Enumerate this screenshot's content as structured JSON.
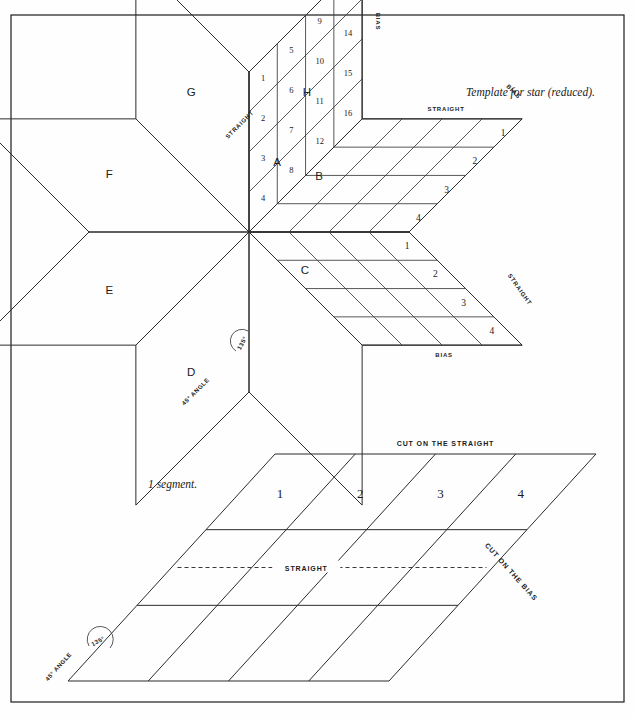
{
  "page": {
    "background": "#fefefe",
    "ink": "#2b2b2b",
    "width": 634,
    "height": 719,
    "frame": {
      "x": 11,
      "y": 15,
      "w": 613,
      "h": 687
    }
  },
  "captions": {
    "star": "Template for star (reduced).",
    "segment": "1 segment."
  },
  "star": {
    "center": {
      "x": 249,
      "y": 232
    },
    "arm": 160,
    "letters": [
      "A",
      "B",
      "C",
      "D",
      "E",
      "F",
      "G",
      "H"
    ],
    "plain_letters": [
      "D",
      "E",
      "F",
      "G",
      "H"
    ],
    "gridded_letters": [
      "A",
      "B",
      "C"
    ],
    "angle_arc_label": "135°",
    "angle_edge_label": "45° ANGLE",
    "edge_labels": {
      "straight": "STRAIGHT",
      "bias": "BIAS"
    },
    "segment_A": {
      "letter": "A",
      "cells": [
        1,
        2,
        3,
        4,
        5,
        6,
        7,
        8,
        9,
        10,
        11,
        12,
        13,
        14,
        15,
        16
      ],
      "rows": 4,
      "cols": 4,
      "edge_top": "STRAIGHT",
      "edge_side": "BIAS"
    },
    "segment_B": {
      "letter": "B",
      "numbers": [
        1,
        2,
        3,
        4
      ],
      "edge_top": "STRAIGHT",
      "edge_side": "BIAS"
    },
    "segment_C": {
      "letter": "C",
      "numbers": [
        1,
        2,
        3,
        4
      ],
      "edge_side": "STRAIGHT",
      "edge_bottom": "BIAS"
    }
  },
  "segment_panel": {
    "numbers": [
      "1",
      "2",
      "3",
      "4"
    ],
    "label_top": "CUT ON THE STRAIGHT",
    "label_middle": "STRAIGHT",
    "label_bias": "CUT ON THE BIAS",
    "angle_arc_label": "135°",
    "angle_edge_label": "45° ANGLE",
    "geometry": {
      "top_left": {
        "x": 275,
        "y": 454
      },
      "top_right": {
        "x": 596,
        "y": 454
      },
      "bottom_left": {
        "x": 68,
        "y": 681
      },
      "bottom_right": {
        "x": 389,
        "y": 681
      },
      "columns": 4,
      "rows": 3
    }
  }
}
